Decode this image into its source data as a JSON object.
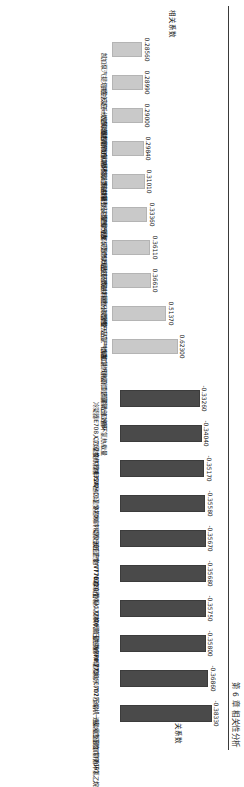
{
  "page": {
    "header_text": "第 6 章   相关性分析"
  },
  "chart_data": [
    {
      "id": "positive-correlation-chart",
      "type": "bar",
      "title": "",
      "ylabel": "相关系数",
      "xlabel": "",
      "orientation": "vertical",
      "bar_color": "#c9c9c9",
      "ylim": [
        0,
        0.65
      ],
      "grid": false,
      "legend": "none",
      "categories": [
        "凯加泵汽提塔顶冷凝系统空冷器后管线",
        "共生反应一次风流量调节(FIC7555)",
        "连续重整预加氢循环氢给料总量",
        "连续重整装置进料轻烃总量重分炭",
        "连续重整装置气产品C5及C5以上组分",
        "连续重整装置气产品丁丁烷",
        "连续重整装置进料重分炭含量",
        "连续重整装置气产品氢气含量",
        "重整反应产物进口物理吸附到周期洗涤效率",
        "常加氢汽化口工艺富氧出口循环氢热载量"
      ],
      "values": [
        0.2856,
        0.2899,
        0.29,
        0.2984,
        0.3101,
        0.3336,
        0.3611,
        0.3661,
        0.5137,
        0.623
      ],
      "value_labels": [
        "0.28560",
        "0.28990",
        "0.29000",
        "0.29840",
        "0.31010",
        "0.33360",
        "0.36110",
        "0.36610",
        "0.51370",
        "0.62300"
      ]
    },
    {
      "id": "negative-correlation-chart",
      "type": "bar",
      "title": "",
      "ylabel": "相关系数",
      "xlabel": "",
      "orientation": "vertical",
      "bar_color": "#4a4a4a",
      "ylim": [
        0,
        0.4
      ],
      "grid": false,
      "legend": "none",
      "categories": [
        "冷凝器E708入口温度(TT7031A)",
        "C702换热器后(ST7401)",
        "E720出口温度控制(TIC7730)",
        "A701冷凝器出口温度(TT7021)",
        "反应产物V770罐液面(LIC7730)",
        "E720/管程入口换代流量控制(FIC77...",
        "V770测压力指示(PI7730)",
        "V770温度指示(TI7731)",
        "C702压缩机一级入口温度(TT7097...",
        "连续重整预加氢循环氢乙烷"
      ],
      "values": [
        -0.3326,
        -0.3404,
        -0.3517,
        -0.3558,
        -0.3567,
        -0.3568,
        -0.3575,
        -0.358,
        -0.3686,
        -0.3833
      ],
      "value_labels": [
        "-0.33260",
        "-0.34040",
        "-0.35170",
        "-0.35580",
        "-0.35670",
        "-0.35680",
        "-0.35750",
        "-0.35800",
        "-0.36860",
        "-0.38330"
      ]
    }
  ]
}
